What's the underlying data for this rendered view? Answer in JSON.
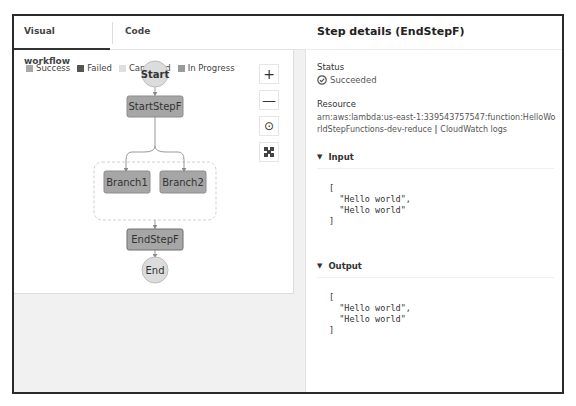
{
  "tabs": [
    {
      "label": "Visual workflow",
      "active": true
    },
    {
      "label": "Code",
      "active": false
    }
  ],
  "legend": [
    {
      "label": "Success",
      "color": "#a8a8a8"
    },
    {
      "label": "Failed",
      "color": "#555555"
    },
    {
      "label": "Cancelled",
      "color": "#dedede"
    },
    {
      "label": "In Progress",
      "color": "#9a9a9a"
    }
  ],
  "zoom_controls": {
    "zoom_in": "+",
    "zoom_out": "—",
    "center": "⊙",
    "fit": "⛶"
  },
  "workflow": {
    "start": "Start",
    "start_step": "StartStepF",
    "branches": [
      "Branch1",
      "Branch2"
    ],
    "end_step": "EndStepF",
    "end": "End"
  },
  "details": {
    "title": "Step details (EndStepF)",
    "status_label": "Status",
    "status_value": "Succeeded",
    "resource_label": "Resource",
    "resource_arn": "arn:aws:lambda:us-east-1:339543757547:function:HelloWorldStepFunctions-dev-reduce",
    "separator": " | ",
    "cloudwatch_link": "CloudWatch logs",
    "input_label": "Input",
    "input_code": "[\n  \"Hello world\",\n  \"Hello world\"\n]",
    "output_label": "Output",
    "output_code": "[\n  \"Hello world\",\n  \"Hello world\"\n]"
  }
}
